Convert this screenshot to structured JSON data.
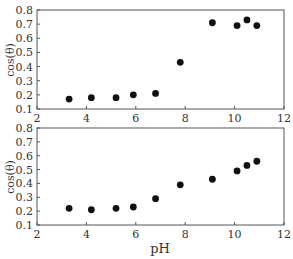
{
  "chart_data": [
    {
      "type": "scatter",
      "title": "",
      "xlabel": "",
      "ylabel": "cos(θ)",
      "xlim": [
        2,
        12
      ],
      "ylim": [
        0.1,
        0.8
      ],
      "xticks": [
        2,
        4,
        6,
        8,
        10,
        12
      ],
      "yticks": [
        0.1,
        0.2,
        0.3,
        0.4,
        0.5,
        0.6,
        0.7,
        0.8
      ],
      "grid": false,
      "series": [
        {
          "name": "top",
          "x": [
            3.3,
            4.2,
            5.2,
            5.9,
            6.8,
            7.8,
            9.1,
            10.1,
            10.5,
            10.9
          ],
          "y": [
            0.17,
            0.18,
            0.18,
            0.2,
            0.21,
            0.43,
            0.71,
            0.69,
            0.73,
            0.69
          ]
        }
      ]
    },
    {
      "type": "scatter",
      "title": "",
      "xlabel": "pH",
      "ylabel": "cos(θ)",
      "xlim": [
        2,
        12
      ],
      "ylim": [
        0.1,
        0.8
      ],
      "xticks": [
        2,
        4,
        6,
        8,
        10,
        12
      ],
      "yticks": [
        0.1,
        0.2,
        0.3,
        0.4,
        0.5,
        0.6,
        0.7,
        0.8
      ],
      "grid": false,
      "series": [
        {
          "name": "bottom",
          "x": [
            3.3,
            4.2,
            5.2,
            5.9,
            6.8,
            7.8,
            9.1,
            10.1,
            10.5,
            10.9
          ],
          "y": [
            0.22,
            0.21,
            0.22,
            0.23,
            0.29,
            0.39,
            0.43,
            0.49,
            0.53,
            0.56
          ]
        }
      ]
    }
  ],
  "labels": {
    "top_ylabel": "cos(θ)",
    "bottom_ylabel": "cos(θ)",
    "xlabel": "pH"
  }
}
